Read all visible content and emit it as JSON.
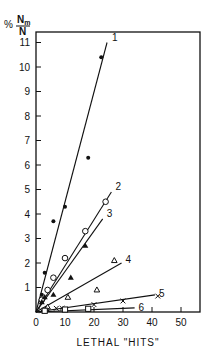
{
  "chart_data": {
    "type": "scatter",
    "title": "",
    "xlabel": "LETHAL \"HITS\"",
    "ylabel": "% Nm/N",
    "ylabel_parts": {
      "prefix": "%",
      "numerator": "N",
      "numerator_sub": "m",
      "denominator": "N"
    },
    "xlim": [
      0,
      55
    ],
    "ylim": [
      0,
      11.5
    ],
    "xticks": [
      0,
      10,
      20,
      30,
      40,
      50
    ],
    "yticks": [
      1,
      2,
      3,
      4,
      5,
      6,
      7,
      8,
      9,
      10,
      11
    ],
    "grid": false,
    "legend": "none (lines labeled inline 1-6)",
    "series": [
      {
        "name": "1",
        "marker": "filled-circle",
        "line": [
          [
            0,
            0
          ],
          [
            24.5,
            11.0
          ]
        ],
        "points": [
          [
            2,
            0.7
          ],
          [
            3,
            1.6
          ],
          [
            6,
            3.7
          ],
          [
            10,
            4.3
          ],
          [
            18,
            6.3
          ],
          [
            22.5,
            10.4
          ]
        ]
      },
      {
        "name": "2",
        "marker": "open-circle",
        "line": [
          [
            0,
            0
          ],
          [
            26,
            4.9
          ]
        ],
        "points": [
          [
            2,
            0.5
          ],
          [
            4,
            0.9
          ],
          [
            6,
            1.4
          ],
          [
            10,
            2.2
          ],
          [
            17,
            3.3
          ],
          [
            24,
            4.5
          ]
        ]
      },
      {
        "name": "3",
        "marker": "filled-triangle",
        "line": [
          [
            0,
            0
          ],
          [
            23,
            3.8
          ]
        ],
        "points": [
          [
            2,
            0.4
          ],
          [
            3,
            0.6
          ],
          [
            6,
            0.7
          ],
          [
            12,
            1.4
          ],
          [
            17,
            2.7
          ]
        ]
      },
      {
        "name": "4",
        "marker": "open-triangle",
        "line": [
          [
            0,
            0
          ],
          [
            29.5,
            2.0
          ]
        ],
        "points": [
          [
            4,
            0.2
          ],
          [
            11,
            0.6
          ],
          [
            21,
            0.9
          ],
          [
            27,
            2.1
          ]
        ]
      },
      {
        "name": "5",
        "marker": "x",
        "line": [
          [
            0,
            0
          ],
          [
            41,
            0.7
          ]
        ],
        "points": [
          [
            2,
            0.05
          ],
          [
            4,
            0.1
          ],
          [
            7,
            0.15
          ],
          [
            9,
            0.15
          ],
          [
            20,
            0.3
          ],
          [
            30,
            0.45
          ],
          [
            42,
            0.65
          ]
        ]
      },
      {
        "name": "6",
        "marker": "open-square",
        "line": [
          [
            0,
            0
          ],
          [
            34,
            0.17
          ]
        ],
        "points": [
          [
            3,
            0.05
          ],
          [
            10,
            0.1
          ],
          [
            18,
            0.13
          ]
        ]
      }
    ]
  },
  "labels": {
    "y_prefix": "%",
    "y_num": "N",
    "y_num_sub": "m",
    "y_den": "N",
    "x_title": "LETHAL \"HITS\""
  }
}
